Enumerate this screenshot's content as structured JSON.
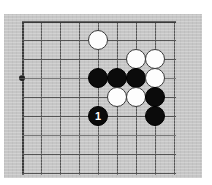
{
  "diagram": {
    "kind": "go-board-diagram",
    "board_label": "Go board corner diagram",
    "colors": {
      "page_background": "#ffffff",
      "board_background": "#c6c6c6",
      "grid_line": "#555555",
      "border_line": "#3a3a3a",
      "black_stone": "#0b0b0b",
      "white_stone": "#fdfdfd",
      "star_point": "#202020",
      "black_stone_label": "#ffffff"
    },
    "geometry": {
      "image_width": 212,
      "image_height": 185,
      "plate_left": 4,
      "plate_top": 14,
      "plate_width": 198,
      "plate_height": 164,
      "grid_spacing": 19,
      "grid_origin_x": 18,
      "grid_origin_y": 7,
      "columns": 9,
      "rows": 9,
      "stone_diameter": 20
    },
    "grid": {
      "vertical_lines_x": [
        18,
        37,
        56,
        75,
        94,
        113,
        132,
        151,
        170
      ],
      "horizontal_lines_y": [
        7,
        26,
        45,
        64,
        83,
        102,
        121,
        140,
        159
      ],
      "edge_vertical_index": 0,
      "edge_horizontal_index": 0
    },
    "star_points": [
      {
        "name": "hoshi-4-4",
        "col": 0,
        "row": 3
      }
    ],
    "stones": [
      {
        "name": "white-stone-top",
        "color": "white",
        "col": 4,
        "row": 1,
        "label": ""
      },
      {
        "name": "white-stone-upper-right-a",
        "color": "white",
        "col": 6,
        "row": 2,
        "label": ""
      },
      {
        "name": "white-stone-upper-right-b",
        "color": "white",
        "col": 7,
        "row": 2,
        "label": ""
      },
      {
        "name": "black-stone-row-a",
        "color": "black",
        "col": 4,
        "row": 3,
        "label": ""
      },
      {
        "name": "black-stone-row-b",
        "color": "black",
        "col": 5,
        "row": 3,
        "label": ""
      },
      {
        "name": "black-stone-row-c",
        "color": "black",
        "col": 6,
        "row": 3,
        "label": ""
      },
      {
        "name": "white-stone-right-middle",
        "color": "white",
        "col": 7,
        "row": 3,
        "label": ""
      },
      {
        "name": "white-stone-lower-a",
        "color": "white",
        "col": 5,
        "row": 4,
        "label": ""
      },
      {
        "name": "white-stone-lower-b",
        "color": "white",
        "col": 6,
        "row": 4,
        "label": ""
      },
      {
        "name": "black-stone-right-a",
        "color": "black",
        "col": 7,
        "row": 4,
        "label": ""
      },
      {
        "name": "black-stone-move-1",
        "color": "black",
        "col": 4,
        "row": 5,
        "label": "1"
      },
      {
        "name": "black-stone-right-b",
        "color": "black",
        "col": 7,
        "row": 5,
        "label": ""
      }
    ]
  }
}
